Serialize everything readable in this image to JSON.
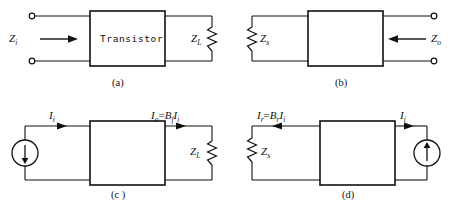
{
  "figure": {
    "width": 463,
    "height": 216,
    "background": "#ffffff",
    "line_color": "#111111",
    "panels": [
      {
        "id": "a",
        "caption": "(a)",
        "box_label": "Transistor",
        "left_terminals": "open-circles",
        "right_element": "resistor",
        "labels": {
          "input_impedance": "Z",
          "input_impedance_sub": "i",
          "load": "Z",
          "load_sub": "L"
        },
        "arrow_direction": "right"
      },
      {
        "id": "b",
        "caption": "(b)",
        "box_label": "",
        "right_terminals": "open-circles",
        "left_element": "resistor",
        "labels": {
          "source_impedance": "Z",
          "source_impedance_sub": "s",
          "output_impedance": "Z",
          "output_impedance_sub": "o"
        },
        "arrow_direction": "left"
      },
      {
        "id": "c",
        "caption": "(c )",
        "box_label": "",
        "left_element": "current-source-down",
        "right_element": "resistor",
        "labels": {
          "input_current": "I",
          "input_current_sub": "i",
          "output_current": "I",
          "output_current_sub": "o",
          "output_current_expr_eq": "=",
          "output_current_expr_gain": "B",
          "output_current_expr_gain_sub": "f",
          "output_current_expr_term": "I",
          "output_current_expr_term_sub": "i",
          "load": "Z",
          "load_sub": "L"
        }
      },
      {
        "id": "d",
        "caption": "(d)",
        "box_label": "",
        "left_element": "resistor",
        "right_element": "current-source-up",
        "labels": {
          "reverse_current": "I",
          "reverse_current_sub": "r",
          "reverse_expr_eq": "=",
          "reverse_expr_gain": "B",
          "reverse_expr_gain_sub": "r",
          "reverse_expr_term": "I",
          "reverse_expr_term_sub": "i",
          "input_current": "I",
          "input_current_sub": "i",
          "source_impedance": "Z",
          "source_impedance_sub": "s"
        }
      }
    ]
  }
}
